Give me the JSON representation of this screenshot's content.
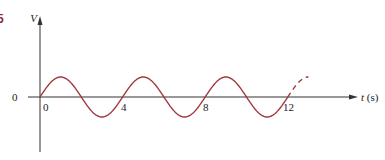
{
  "figure": {
    "corner_mark": "5",
    "y_axis_label": "V",
    "x_axis_label_var": "t",
    "x_axis_label_unit": " (s)",
    "y_origin_label": "0",
    "x_tick_labels": [
      "0",
      "4",
      "8",
      "12"
    ],
    "curve_color": "#a03a3f",
    "axis_color": "#333333"
  },
  "chart_data": {
    "type": "line",
    "title": "",
    "xlabel": "t (s)",
    "ylabel": "V",
    "function": "V = A sin(2*pi*t/4)",
    "period": 4,
    "x_ticks": [
      0,
      4,
      8,
      12
    ],
    "xlim": [
      0,
      13
    ],
    "solid_range": [
      0,
      12
    ],
    "dashed_range": [
      12,
      13
    ],
    "grid": false
  }
}
